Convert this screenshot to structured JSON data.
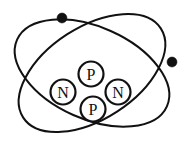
{
  "figure": {
    "background_color": "#ffffff",
    "line_color": "#111111",
    "width": 186,
    "height": 149
  },
  "nucleus": {
    "label": "nucleus",
    "particle_radius": 12.5,
    "particles": [
      {
        "name": "neutron-left",
        "symbol": "N",
        "cx": 63,
        "cy": 92
      },
      {
        "name": "proton-top",
        "symbol": "P",
        "cx": 91,
        "cy": 74
      },
      {
        "name": "neutron-right",
        "symbol": "N",
        "cx": 118,
        "cy": 92
      },
      {
        "name": "proton-bottom",
        "symbol": "P",
        "cx": 93,
        "cy": 109
      }
    ],
    "proton_count": 2,
    "neutron_count": 2
  },
  "orbits": [
    {
      "name": "orbit-one",
      "cx": 92,
      "cy": 73,
      "rx": 82,
      "ry": 46,
      "rotation_deg": -33,
      "electron": {
        "name": "electron-one",
        "cx": 62,
        "cy": 18,
        "r": 5
      }
    },
    {
      "name": "orbit-two",
      "cx": 92,
      "cy": 73,
      "rx": 82,
      "ry": 46,
      "rotation_deg": 24,
      "electron": {
        "name": "electron-two",
        "cx": 172,
        "cy": 62,
        "r": 5
      }
    }
  ]
}
